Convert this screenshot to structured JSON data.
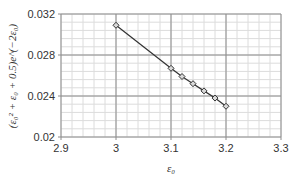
{
  "chart_data": {
    "type": "line",
    "title": "",
    "xlabel": "ε₀",
    "ylabel": "(ε₀² + ε₀ + 0.5)e^(−2ε₀)",
    "xlim": [
      2.9,
      3.3
    ],
    "ylim": [
      0.02,
      0.032
    ],
    "x_ticks": [
      "2.9",
      "3",
      "3.1",
      "3.2",
      "3.3"
    ],
    "y_ticks": [
      "0.02",
      "0.024",
      "0.028",
      "0.032"
    ],
    "grid": true,
    "legend": null,
    "series": [
      {
        "name": "(ε₀² + ε₀ + 0.5)e^(−2ε₀)",
        "marker": "diamond",
        "color": "#333333",
        "x": [
          3.0,
          3.1,
          3.12,
          3.14,
          3.16,
          3.18,
          3.2
        ],
        "y": [
          0.0309,
          0.0267,
          0.0259,
          0.0252,
          0.0245,
          0.0238,
          0.023
        ]
      }
    ]
  },
  "colors": {
    "major_grid": "#8c8c8c",
    "minor_grid": "#dcdcdc",
    "line": "#333333",
    "marker_fill": "#d9d9d9"
  }
}
